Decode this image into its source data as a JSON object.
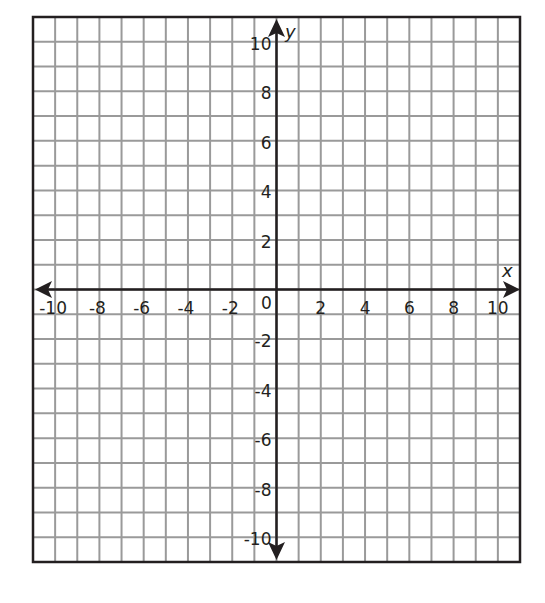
{
  "diagram": {
    "type": "coordinate-plane",
    "x_axis": {
      "label": "x",
      "min": -11,
      "max": 11,
      "tick_step": 2,
      "tick_labels": [
        "-10",
        "-8",
        "-6",
        "-4",
        "-2",
        "2",
        "4",
        "6",
        "8",
        "10"
      ]
    },
    "y_axis": {
      "label": "y",
      "min": -11,
      "max": 11,
      "tick_step": 2,
      "tick_labels": [
        "10",
        "8",
        "6",
        "4",
        "2",
        "-2",
        "-4",
        "-6",
        "-8",
        "-10"
      ]
    },
    "origin_label": "0",
    "grid": {
      "columns": 22,
      "rows": 22,
      "unit": 1
    },
    "colors": {
      "grid_line": "#9a9a9a",
      "axis": "#231f20",
      "frame": "#231f20",
      "background": "#ffffff"
    }
  }
}
